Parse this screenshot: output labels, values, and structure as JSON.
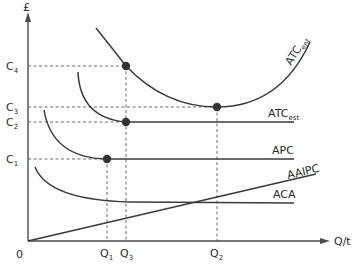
{
  "diagram": {
    "y_axis_label": "£",
    "x_axis_label": "Q/t",
    "origin_label": "0",
    "y_ticks": [
      {
        "base": "C",
        "sub": "4",
        "y": 66
      },
      {
        "base": "C",
        "sub": "3",
        "y": 107
      },
      {
        "base": "C",
        "sub": "2",
        "y": 122
      },
      {
        "base": "C",
        "sub": "1",
        "y": 159
      }
    ],
    "x_ticks": [
      {
        "base": "Q",
        "sub": "1",
        "x": 107
      },
      {
        "base": "Q",
        "sub": "3",
        "x": 126
      },
      {
        "base": "Q",
        "sub": "2",
        "x": 217
      }
    ],
    "curves": [
      {
        "id": "atc-ent",
        "base": "ATC",
        "sub": "ent",
        "desc": "U-shaped entrant average total cost curve"
      },
      {
        "id": "atc-est",
        "base": "ATC",
        "sub": "est",
        "desc": "Established firm average total cost, falls then flat at C2"
      },
      {
        "id": "apc",
        "base": "APC",
        "sub": "",
        "desc": "Average production cost, falls then flat at C1"
      },
      {
        "id": "aaipc",
        "base": "AAIPC",
        "sub": "",
        "desc": "Upward sloping line from origin"
      },
      {
        "id": "aca",
        "base": "ACA",
        "sub": "",
        "desc": "Falling curve levelling out"
      }
    ],
    "points": [
      {
        "label": "ATC_ent at Q3, C4",
        "x": 126,
        "y": 66
      },
      {
        "label": "ATC_ent minimum at Q2, C3",
        "x": 217,
        "y": 107
      },
      {
        "label": "ATC_est at Q3, C2",
        "x": 126,
        "y": 122
      },
      {
        "label": "APC at Q1, C1",
        "x": 107,
        "y": 159
      }
    ]
  }
}
